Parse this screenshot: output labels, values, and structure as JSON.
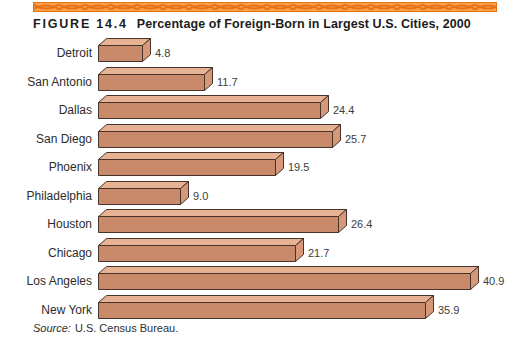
{
  "figure": {
    "label": "FIGURE 14.4",
    "title": "Percentage of Foreign-Born in Largest U.S. Cities, 2000"
  },
  "source": {
    "prefix": "Source:",
    "text": "U.S. Census Bureau."
  },
  "colors": {
    "band_bg": "#F9A04A",
    "band_wave": "#E87118",
    "band_edge": "#E3720F",
    "bar_front": "#C98A6B",
    "bar_top": "#E7B294",
    "bar_side": "#D69878",
    "bar_outline": "#46342A",
    "label_text": "#2B2B2B",
    "value_text": "#3D3D3D"
  },
  "chart_data": {
    "type": "bar",
    "orientation": "horizontal",
    "title": "Percentage of Foreign-Born in Largest U.S. Cities, 2000",
    "categories": [
      "Detroit",
      "San Antonio",
      "Dallas",
      "San Diego",
      "Phoenix",
      "Philadelphia",
      "Houston",
      "Chicago",
      "Los Angeles",
      "New York"
    ],
    "values": [
      4.8,
      11.7,
      24.4,
      25.7,
      19.5,
      9.0,
      26.4,
      21.7,
      40.9,
      35.9
    ],
    "xlabel": "",
    "ylabel": "",
    "xlim": [
      0,
      45
    ],
    "grid": false,
    "legend": false,
    "value_labels_shown": true,
    "source": "U.S. Census Bureau."
  }
}
